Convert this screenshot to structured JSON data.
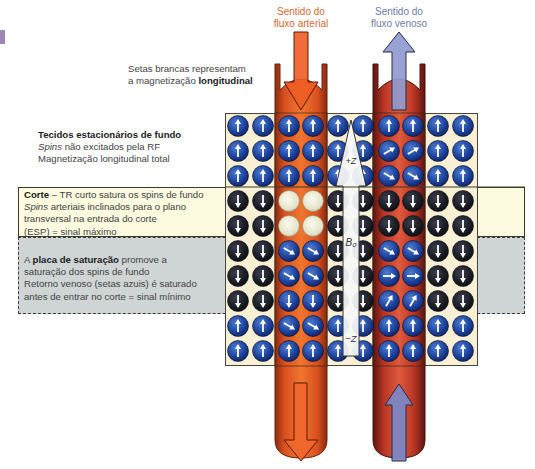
{
  "header": {
    "arterial_flow_label_line1": "Sentido do",
    "arterial_flow_label_line2": "fluxo arterial",
    "venous_flow_label_line1": "Sentido do",
    "venous_flow_label_line2": "fluxo venoso"
  },
  "annotations": {
    "white_arrows": {
      "line1": "Setas brancas representam",
      "line2_prefix": "a magnetização ",
      "line2_bold": "longitudinal"
    },
    "stationary_tissue": {
      "title": "Tecidos estacionários de fundo",
      "line2_italic": "Spins",
      "line2_rest": " não excitados pela RF",
      "line3": "Magnetização longitudinal total"
    },
    "slice": {
      "title_bold": "Corte",
      "title_rest": " – TR curto satura os spins de fundo",
      "line2_italic": "Spins",
      "line2_rest": " arteriais inclinados para o plano",
      "line3": "transversal na entrada do corte",
      "line4": "(ESP) = sinal máximo"
    },
    "saturation_band": {
      "line1_prefix": "A ",
      "line1_bold": "placa de saturação",
      "line1_rest": " promove a",
      "line2": "saturação dos spins de fundo",
      "line3": "Retorno venoso (setas azuis) é saturado",
      "line4": "antes de entrar no corte = sinal mínimo"
    }
  },
  "field_arrow": {
    "top_label": "+Z",
    "middle_label": "B₀",
    "bottom_label": "−Z"
  },
  "colors": {
    "arterial": "#e0662c",
    "venous": "#6d7aaa",
    "spin_blue": "#1d3f8f",
    "spin_dark": "#1a1c24",
    "spin_saturated_light": "#e9e9d2",
    "slice_band": "#fcfadf",
    "saturation_band": "#cfd4d4",
    "grid_background": "#f7f0d4"
  },
  "grid": {
    "columns": 10,
    "rows": 10,
    "arterial_columns": [
      2,
      3
    ],
    "venous_columns": [
      6,
      7
    ],
    "field_columns": [
      4,
      5
    ],
    "rows_legend": [
      "stationary-up",
      "stationary-up",
      "stationary-up",
      "slice",
      "slice",
      "saturation",
      "saturation",
      "saturation",
      "stationary-up",
      "stationary-up"
    ]
  }
}
